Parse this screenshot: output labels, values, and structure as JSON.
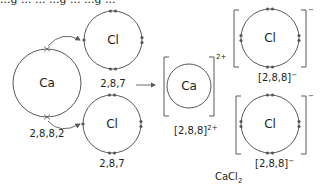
{
  "caption_fragment": "...g ... ... ...g ... ...g ...",
  "colors": {
    "line": "#58595b",
    "text": "#231f20"
  },
  "atoms": {
    "calcium": {
      "symbol": "Ca",
      "configuration": "2,8,8,2",
      "outer_electrons_transferred": 2
    },
    "chlorine_top": {
      "symbol": "Cl",
      "configuration": "2,8,7",
      "outer_electrons": 7
    },
    "chlorine_bottom": {
      "symbol": "Cl",
      "configuration": "2,8,7",
      "outer_electrons": 7
    }
  },
  "ions": {
    "calcium_ion": {
      "symbol": "Ca",
      "charge": "2+",
      "configuration": "[2,8,8]",
      "configuration_charge": "2+"
    },
    "chloride_top": {
      "symbol": "Cl",
      "charge": "−",
      "configuration": "[2,8,8]",
      "configuration_charge": "−",
      "outer_electrons": 8
    },
    "chloride_bottom": {
      "symbol": "Cl",
      "charge": "−",
      "configuration": "[2,8,8]",
      "configuration_charge": "−",
      "outer_electrons": 8
    }
  },
  "product": {
    "formula_main": "CaCl",
    "formula_subscript": "2"
  },
  "reaction_arrow": "right-arrow"
}
